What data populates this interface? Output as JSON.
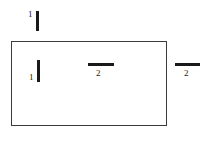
{
  "figure": {
    "background_color": "#ffffff",
    "stroke_color": "#1a1a1a",
    "frame_color": "#3a3a3a",
    "shape": {
      "name": "rectangle",
      "label": ""
    },
    "marks": [
      {
        "id": "mark-top",
        "label": "1",
        "orientation": "vertical",
        "position": "above-rectangle-left"
      },
      {
        "id": "mark-inner-left",
        "label": "1",
        "orientation": "vertical",
        "position": "inside-rectangle-left"
      },
      {
        "id": "mark-inner-center",
        "label": "2",
        "orientation": "horizontal",
        "position": "inside-rectangle-center"
      },
      {
        "id": "mark-right",
        "label": "2",
        "orientation": "horizontal",
        "position": "outside-rectangle-right"
      }
    ]
  }
}
